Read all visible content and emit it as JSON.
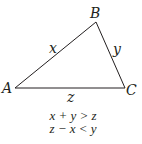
{
  "diagram": {
    "type": "triangle",
    "vertices": {
      "A": "A",
      "B": "B",
      "C": "C"
    },
    "sides": {
      "AB": "x",
      "BC": "y",
      "AC": "z"
    },
    "inequalities": [
      "x + y > z",
      "z − x < y"
    ],
    "stroke_color": "#231f20"
  }
}
